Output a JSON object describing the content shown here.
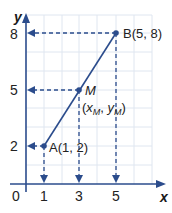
{
  "diagram": {
    "type": "coordinate-grid-midpoint",
    "axes": {
      "x_label": "x",
      "y_label": "y",
      "origin_label": "0"
    },
    "x_ticks": [
      "1",
      "3",
      "5"
    ],
    "y_ticks": [
      "2",
      "5",
      "8"
    ],
    "points": [
      {
        "name": "A",
        "label": "A(1, 2)",
        "x": 1,
        "y": 2
      },
      {
        "name": "M",
        "label": "M",
        "sublabel": "(xM, yM)",
        "x": 3,
        "y": 5
      },
      {
        "name": "B",
        "label": "B(5, 8)",
        "x": 5,
        "y": 8
      }
    ],
    "colors": {
      "line": "#2b4c8c",
      "grid": "#dfe6f0",
      "axis": "#2b4c8c"
    }
  }
}
